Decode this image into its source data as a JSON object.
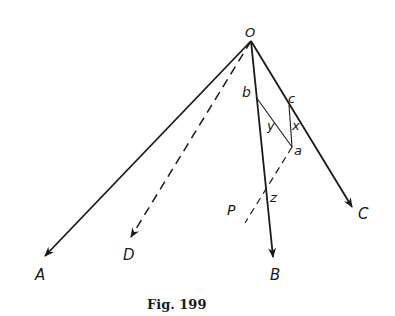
{
  "figure": {
    "caption": "Fig. 199",
    "ink_color": "#1a1a1a",
    "background": "#ffffff"
  },
  "points": {
    "O": {
      "label": "O",
      "x": 251,
      "y": 41
    },
    "A": {
      "label": "A",
      "x": 45,
      "y": 256
    },
    "B": {
      "label": "B",
      "x": 273,
      "y": 257
    },
    "C": {
      "label": "C",
      "x": 352,
      "y": 207
    },
    "D": {
      "label": "D",
      "x": 131,
      "y": 237
    },
    "P": {
      "label": "P",
      "x": 245,
      "y": 223
    },
    "a": {
      "label": "a",
      "x": 292,
      "y": 147
    },
    "b": {
      "label": "b",
      "x": 256,
      "y": 97
    },
    "c": {
      "label": "c",
      "x": 289,
      "y": 105
    },
    "z": {
      "label": "z",
      "x": 266,
      "y": 190
    }
  },
  "segment_labels": {
    "x": "x",
    "y": "y"
  },
  "lines": [
    {
      "from": "O",
      "to": "A",
      "style": "solid",
      "arrow": true
    },
    {
      "from": "O",
      "to": "B",
      "style": "solid",
      "arrow": true
    },
    {
      "from": "O",
      "to": "C",
      "style": "solid",
      "arrow": true
    },
    {
      "from": "O",
      "to": "D",
      "style": "dashed",
      "arrow": true
    },
    {
      "from": "b",
      "to": "a",
      "style": "solid-thin",
      "arrow": false
    },
    {
      "from": "c",
      "to": "a",
      "style": "solid-thin",
      "arrow": false
    },
    {
      "from": "a",
      "to": "P",
      "style": "dashed",
      "arrow": false
    }
  ]
}
